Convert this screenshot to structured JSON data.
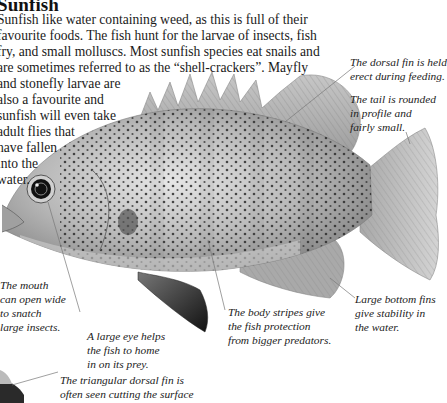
{
  "heading": "Sunfish",
  "intro_lines": [
    "Sunfish like water containing weed, as this is full of their",
    "favourite foods. The fish hunt for the larvae of insects, fish",
    "fry, and small molluscs. Most sunfish species eat snails and",
    "are sometimes referred to as the “shell-crackers”. Mayfly",
    "and stonefly larvae are",
    "also a favourite and",
    "sunfish will even take",
    "adult flies that",
    "have fallen",
    "into the",
    "water."
  ],
  "annotations": {
    "dorsal_fin": [
      "The dorsal fin is held",
      "erect during feeding."
    ],
    "tail": [
      "The tail is rounded",
      "in profile and",
      "fairly small."
    ],
    "mouth": [
      "The mouth",
      "can open wide",
      "to snatch",
      "large insects."
    ],
    "eye": [
      "A large eye helps",
      "the fish to home",
      "in on its prey."
    ],
    "stripes": [
      "The body stripes give",
      "the fish protection",
      "from bigger predators."
    ],
    "bottom_fins": [
      "Large bottom fins",
      "give stability in",
      "the water."
    ],
    "triangular_fin": [
      "The triangular dorsal fin is",
      "often seen cutting the surface"
    ]
  },
  "colors": {
    "text": "#1a1a1a",
    "fish_body": "#b9b9b9",
    "fish_dark": "#3a3a3a",
    "leader_line": "#777777"
  }
}
